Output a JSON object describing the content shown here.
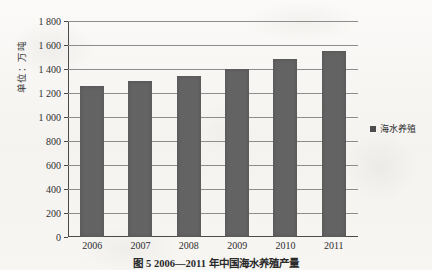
{
  "figure": {
    "caption": "图 5  2006—2011 年中国海水养殖产量",
    "ylabel": "单位：万吨"
  },
  "legend": {
    "position": "right",
    "swatch_color": "#4d4d4d",
    "entries": [
      {
        "label": "海水养殖"
      }
    ]
  },
  "chart_data": {
    "type": "bar",
    "title": "图 5  2006—2011 年中国海水养殖产量",
    "xlabel": "",
    "ylabel": "单位：万吨",
    "categories": [
      "2006",
      "2007",
      "2008",
      "2009",
      "2010",
      "2011"
    ],
    "series": [
      {
        "name": "海水养殖",
        "color": "#636363",
        "values": [
          1260,
          1300,
          1340,
          1400,
          1480,
          1550
        ]
      }
    ],
    "ylim": [
      0,
      1800
    ],
    "ytick_step": 200,
    "ytick_labels": [
      "0",
      "200",
      "400",
      "600",
      "800",
      "1 000",
      "1 200",
      "1 400",
      "1 600",
      "1 800"
    ],
    "ytick_values": [
      0,
      200,
      400,
      600,
      800,
      1000,
      1200,
      1400,
      1600,
      1800
    ],
    "grid": true,
    "legend_position": "right"
  }
}
